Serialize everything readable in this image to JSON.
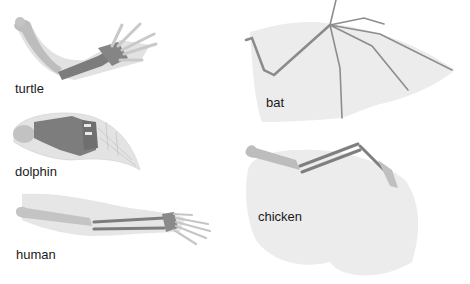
{
  "diagram": {
    "panels": [
      {
        "id": "turtle",
        "label": "turtle"
      },
      {
        "id": "dolphin",
        "label": "dolphin"
      },
      {
        "id": "human",
        "label": "human"
      },
      {
        "id": "bat",
        "label": "bat"
      },
      {
        "id": "chicken",
        "label": "chicken"
      }
    ],
    "colors": {
      "skin": "#dcdcdc",
      "membrane": "#e9e9e9",
      "upper_bone": "#bdbdbd",
      "lower_bone": "#7f7f7f",
      "hand_bone": "#cfcfcf",
      "text": "#1a1a1a"
    }
  }
}
